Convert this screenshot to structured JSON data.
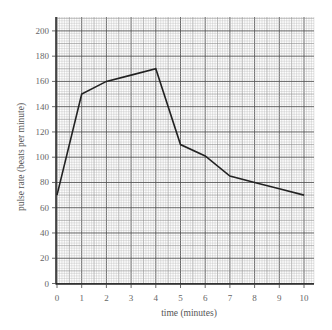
{
  "chart_data": {
    "type": "line",
    "title": "",
    "xlabel": "time (minutes)",
    "ylabel": "pulse rate (beats per minute)",
    "x": [
      0,
      1,
      2,
      3,
      4,
      5,
      6,
      7,
      8,
      9,
      10
    ],
    "series": [
      {
        "name": "pulse rate",
        "values": [
          70,
          150,
          160,
          165,
          170,
          110,
          101,
          85,
          80,
          75,
          70
        ]
      }
    ],
    "xlim": [
      0,
      10.4
    ],
    "ylim": [
      0,
      210
    ],
    "xticks": [
      "0",
      "1",
      "2",
      "3",
      "4",
      "5",
      "6",
      "7",
      "8",
      "9",
      "10"
    ],
    "yticks": [
      "0",
      "20",
      "40",
      "60",
      "80",
      "100",
      "120",
      "140",
      "160",
      "180",
      "200"
    ],
    "grid": "graph-paper (major every 1 min / 20 bpm, minor every 0.1 min / 2 bpm)",
    "legend": "none",
    "colors": {
      "line": "#222222",
      "grid_major": "#555555",
      "grid_mid": "#8a8a8a",
      "grid_minor": "#b8b8b8",
      "text": "#666666"
    }
  }
}
